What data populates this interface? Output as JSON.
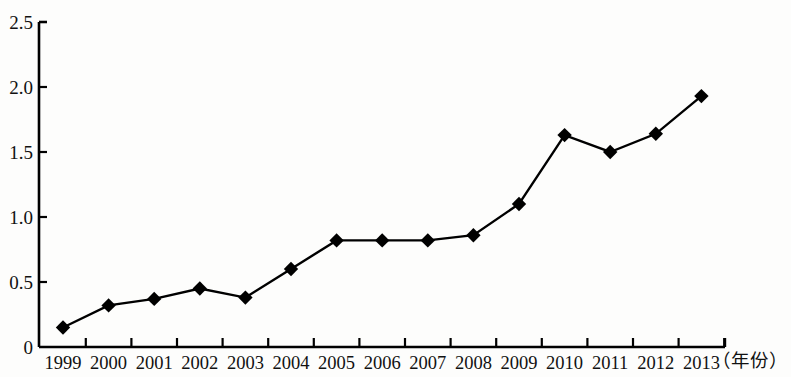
{
  "chart_data": {
    "type": "line",
    "title": "",
    "subtitle": "",
    "xlabel": "（年份）",
    "ylabel": "",
    "categories": [
      "1999",
      "2000",
      "2001",
      "2002",
      "2003",
      "2004",
      "2005",
      "2006",
      "2007",
      "2008",
      "2009",
      "2010",
      "2011",
      "2012",
      "2013"
    ],
    "values": [
      0.15,
      0.32,
      0.37,
      0.45,
      0.38,
      0.6,
      0.82,
      0.82,
      0.82,
      0.86,
      1.1,
      1.63,
      1.5,
      1.64,
      1.93
    ],
    "series": [
      {
        "name": "",
        "values": [
          0.15,
          0.32,
          0.37,
          0.45,
          0.38,
          0.6,
          0.82,
          0.82,
          0.82,
          0.86,
          1.1,
          1.63,
          1.5,
          1.64,
          1.93
        ]
      }
    ],
    "ylim": [
      0,
      2.5
    ],
    "ytick_labels": [
      "0",
      "0.5",
      "1.0",
      "1.5",
      "2.0",
      "2.5"
    ],
    "ytick_values": [
      0,
      0.5,
      1.0,
      1.5,
      2.0,
      2.5
    ],
    "grid": false,
    "legend": false,
    "legend_position": "none",
    "marker": "diamond",
    "line_color": "#000000",
    "marker_color": "#000000",
    "axis_color": "#000000"
  }
}
